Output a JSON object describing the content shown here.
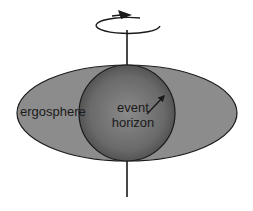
{
  "diagram": {
    "labels": {
      "ergosphere": "ergosphere",
      "event_horizon_line1": "event",
      "event_horizon_line2": "horizon"
    },
    "elements": {
      "rotation_axis": "vertical line through center",
      "rotation_arrow": "curved arrow indicating rotation (counter-clockwise from above)",
      "ergosphere_shape": "oblate ellipse",
      "event_horizon_shape": "sphere",
      "radius_arrow": "arrow pointing from label to horizon edge"
    },
    "colors": {
      "background": "#ffffff",
      "ergosphere_fill": "#8c8c8c",
      "horizon_fill_center": "#8a8a8a",
      "horizon_fill_edge": "#4a4a4a",
      "stroke": "#1a1a1a"
    }
  }
}
